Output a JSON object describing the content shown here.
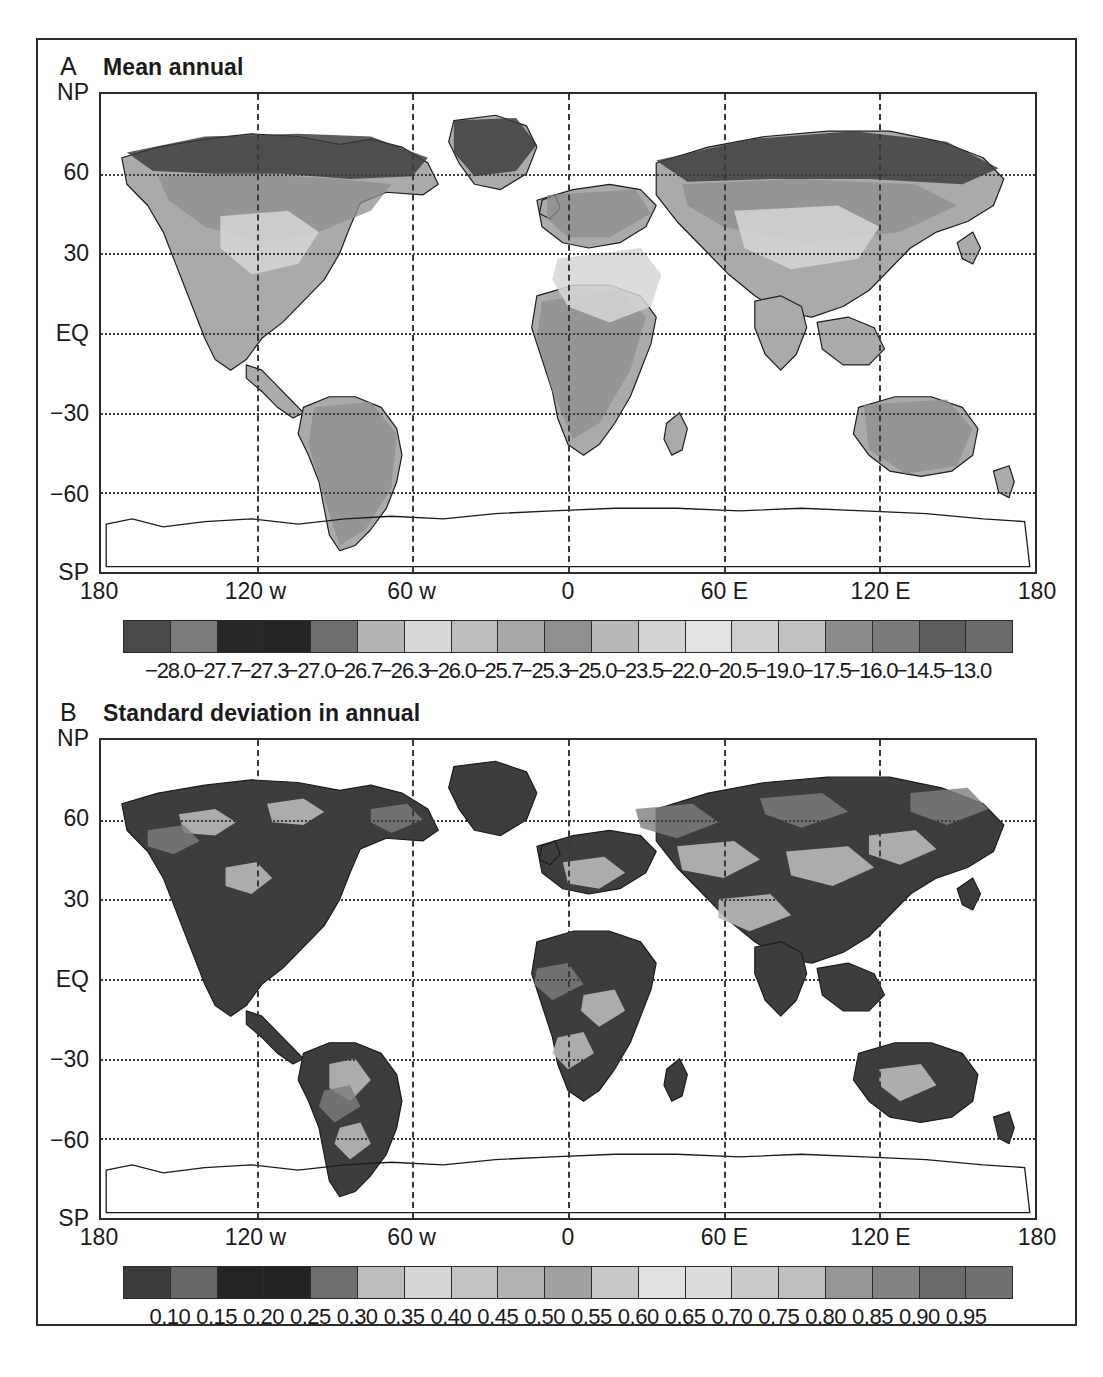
{
  "figure": {
    "background": "#ffffff",
    "frame_color": "#2b2b2b"
  },
  "panels": [
    {
      "letter": "A",
      "title": "Mean annual",
      "yticks": [
        "NP",
        "60",
        "30",
        "EQ",
        "−30",
        "−60",
        "SP"
      ],
      "xticks": [
        "180",
        "120 w",
        "60 w",
        "0",
        "60 E",
        "120 E",
        "180"
      ],
      "colorbar": {
        "labels": [
          "−28.0",
          "−27.7",
          "−27.3",
          "−27.0",
          "−26.7",
          "−26.3",
          "−26.0",
          "−25.7",
          "−25.3",
          "−25.0",
          "−23.5",
          "−22.0",
          "−20.5",
          "−19.0",
          "−17.5",
          "−16.0",
          "−14.5",
          "−13.0"
        ],
        "colors": [
          "#4a4a4a",
          "#7c7c7c",
          "#272727",
          "#242424",
          "#6e6e6e",
          "#b4b4b4",
          "#d8d8d8",
          "#bdbdbd",
          "#a8a8a8",
          "#8f8f8f",
          "#b8b8b8",
          "#d2d2d2",
          "#e2e2e2",
          "#cfcfcf",
          "#c2c2c2",
          "#8c8c8c",
          "#7a7a7a",
          "#5e5e5e",
          "#6a6a6a"
        ]
      }
    },
    {
      "letter": "B",
      "title": "Standard deviation in annual",
      "yticks": [
        "NP",
        "60",
        "30",
        "EQ",
        "−30",
        "−60",
        "SP"
      ],
      "xticks": [
        "180",
        "120 w",
        "60 w",
        "0",
        "60 E",
        "120 E",
        "180"
      ],
      "colorbar": {
        "labels": [
          "0.10",
          "0.15",
          "0.20",
          "0.25",
          "0.30",
          "0.35",
          "0.40",
          "0.45",
          "0.50",
          "0.55",
          "0.60",
          "0.65",
          "0.70",
          "0.75",
          "0.80",
          "0.85",
          "0.90",
          "0.95"
        ],
        "colors": [
          "#3c3c3c",
          "#676767",
          "#242424",
          "#222222",
          "#6e6e6e",
          "#bcbcbc",
          "#d6d6d6",
          "#c4c4c4",
          "#b2b2b2",
          "#a0a0a0",
          "#c8c8c8",
          "#e0e0e0",
          "#dcdcdc",
          "#cacaca",
          "#bfbfbf",
          "#969696",
          "#828282",
          "#6a6a6a",
          "#707070"
        ]
      }
    }
  ],
  "chart_data": {
    "type": "heatmap",
    "panel_count": 2,
    "projection": "cylindrical equidistant (lat/lon)",
    "xlabel": "",
    "ylabel": "",
    "xlim": [
      -180,
      180
    ],
    "ylim": [
      -90,
      90
    ],
    "grid": true,
    "xtick_values": [
      -180,
      -120,
      -60,
      0,
      60,
      120,
      180
    ],
    "xtick_labels": [
      "180",
      "120 w",
      "60 w",
      "0",
      "60 E",
      "120 E",
      "180"
    ],
    "ytick_values": [
      90,
      60,
      30,
      0,
      -30,
      -60,
      -90
    ],
    "ytick_labels": [
      "NP",
      "60",
      "30",
      "EQ",
      "-30",
      "-60",
      "SP"
    ],
    "panels": [
      {
        "letter": "A",
        "title": "Mean annual",
        "colorbar_type": "discrete",
        "n_cells": 19,
        "boundaries": [
          -28.0,
          -27.7,
          -27.3,
          -27.0,
          -26.7,
          -26.3,
          -26.0,
          -25.7,
          -25.3,
          -25.0,
          -23.5,
          -22.0,
          -20.5,
          -19.0,
          -17.5,
          -16.0,
          -14.5,
          -13.0
        ],
        "range": [
          -28.0,
          -13.0
        ],
        "colormap": "grayscale"
      },
      {
        "letter": "B",
        "title": "Standard deviation in annual",
        "colorbar_type": "discrete",
        "n_cells": 19,
        "boundaries": [
          0.1,
          0.15,
          0.2,
          0.25,
          0.3,
          0.35,
          0.4,
          0.45,
          0.5,
          0.55,
          0.6,
          0.65,
          0.7,
          0.75,
          0.8,
          0.85,
          0.9,
          0.95
        ],
        "range": [
          0.1,
          0.95
        ],
        "colormap": "grayscale"
      }
    ]
  }
}
